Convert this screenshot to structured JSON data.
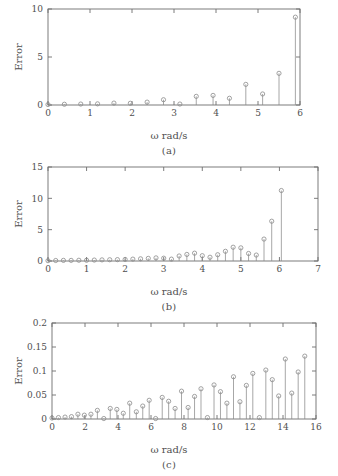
{
  "figure": {
    "panel_labels": [
      "(a)",
      "(b)",
      "(c)"
    ],
    "xlabel": "ω rad/s",
    "ylabel": "Error"
  },
  "chart_data": [
    {
      "type": "stem",
      "panel": "(a)",
      "title": "",
      "xlabel": "ω rad/s",
      "ylabel": "Error",
      "xlim": [
        0,
        6
      ],
      "ylim": [
        0,
        10
      ],
      "xticks": [
        0,
        1,
        2,
        3,
        4,
        5,
        6
      ],
      "xticklabels": [
        "0",
        "1",
        "2",
        "3",
        "4",
        "5",
        "6"
      ],
      "yticks": [
        0,
        5,
        10
      ],
      "yticklabels": [
        "0",
        "5",
        "10"
      ],
      "grid": false,
      "legend": null,
      "marker": "circle-open",
      "x": [
        0.0,
        0.39,
        0.78,
        1.18,
        1.57,
        1.96,
        2.36,
        2.75,
        3.14,
        3.53,
        3.93,
        4.32,
        4.71,
        5.11,
        5.5,
        5.89
      ],
      "y": [
        0.05,
        0.08,
        0.1,
        0.12,
        0.2,
        0.18,
        0.3,
        0.55,
        0.1,
        0.9,
        1.0,
        0.7,
        2.15,
        1.15,
        3.3,
        9.15
      ]
    },
    {
      "type": "stem",
      "panel": "(b)",
      "title": "",
      "xlabel": "ω rad/s",
      "ylabel": "Error",
      "xlim": [
        0,
        7
      ],
      "ylim": [
        0,
        15
      ],
      "xticks": [
        0,
        1,
        2,
        3,
        4,
        5,
        6,
        7
      ],
      "xticklabels": [
        "0",
        "1",
        "2",
        "3",
        "4",
        "5",
        "6",
        "7"
      ],
      "yticks": [
        0,
        5,
        10,
        15
      ],
      "yticklabels": [
        "0",
        "5",
        "10",
        "15"
      ],
      "grid": false,
      "legend": null,
      "marker": "circle-open",
      "x": [
        0.0,
        0.2,
        0.4,
        0.6,
        0.8,
        1.0,
        1.2,
        1.4,
        1.6,
        1.8,
        2.0,
        2.2,
        2.4,
        2.6,
        2.8,
        3.0,
        3.2,
        3.4,
        3.6,
        3.8,
        4.0,
        4.2,
        4.4,
        4.6,
        4.8,
        5.0,
        5.2,
        5.4,
        5.6,
        5.8,
        6.05
      ],
      "y": [
        0.05,
        0.08,
        0.1,
        0.1,
        0.12,
        0.12,
        0.15,
        0.18,
        0.2,
        0.22,
        0.25,
        0.3,
        0.35,
        0.42,
        0.5,
        0.45,
        0.3,
        0.8,
        1.05,
        1.25,
        0.85,
        0.6,
        1.0,
        1.55,
        2.2,
        2.1,
        1.2,
        0.95,
        3.5,
        6.35,
        11.25
      ]
    },
    {
      "type": "stem",
      "panel": "(c)",
      "title": "",
      "xlabel": "ω rad/s",
      "ylabel": "Error",
      "xlim": [
        0,
        16
      ],
      "ylim": [
        0,
        0.2
      ],
      "xticks": [
        0,
        2,
        4,
        6,
        8,
        10,
        12,
        14,
        16
      ],
      "xticklabels": [
        "0",
        "2",
        "4",
        "6",
        "8",
        "10",
        "12",
        "14",
        "16"
      ],
      "yticks": [
        0,
        0.05,
        0.1,
        0.15,
        0.2
      ],
      "yticklabels": [
        "0",
        "0.05",
        "0.1",
        "0.15",
        "0.2"
      ],
      "grid": false,
      "legend": null,
      "marker": "circle-open",
      "x": [
        0.0,
        0.39,
        0.79,
        1.18,
        1.57,
        1.96,
        2.36,
        2.75,
        3.14,
        3.53,
        3.93,
        4.32,
        4.71,
        5.11,
        5.5,
        5.89,
        6.28,
        6.68,
        7.07,
        7.46,
        7.85,
        8.25,
        8.64,
        9.03,
        9.42,
        9.82,
        10.21,
        10.6,
        11.0,
        11.39,
        11.78,
        12.17,
        12.57,
        12.96,
        13.35,
        13.74,
        14.14,
        14.53,
        14.92,
        15.32
      ],
      "y": [
        0.002,
        0.003,
        0.004,
        0.005,
        0.01,
        0.008,
        0.01,
        0.018,
        0.001,
        0.022,
        0.02,
        0.012,
        0.033,
        0.015,
        0.027,
        0.039,
        0.001,
        0.045,
        0.037,
        0.022,
        0.058,
        0.024,
        0.047,
        0.063,
        0.003,
        0.071,
        0.057,
        0.033,
        0.088,
        0.036,
        0.07,
        0.095,
        0.003,
        0.102,
        0.082,
        0.048,
        0.125,
        0.054,
        0.098,
        0.131
      ]
    }
  ]
}
